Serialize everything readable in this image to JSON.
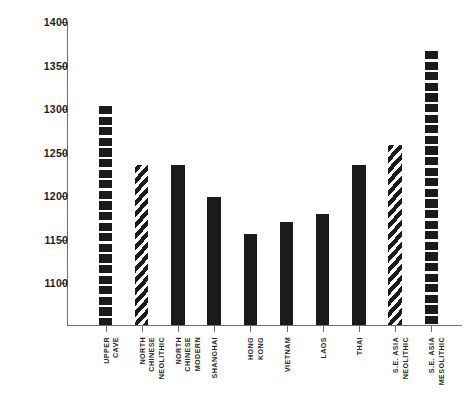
{
  "chart_data": {
    "type": "bar",
    "title": "",
    "subtitle": "",
    "xlabel": "",
    "ylabel": "",
    "ylim": [
      1052,
      1400
    ],
    "grid": false,
    "legend": "none",
    "y_ticks": [
      1100,
      1150,
      1200,
      1250,
      1300,
      1350,
      1400
    ],
    "y_tick_labels": [
      "1100",
      "1150",
      "1200",
      "1250",
      "1300",
      "1350",
      "1400"
    ],
    "categories": [
      "UPPER CAVE",
      "NORTH CHINESE NEOLITHIC",
      "NORTH CHINESE MODERN",
      "SHANGHAI",
      "HONG KONG",
      "VIETNAM",
      "LAOS",
      "THAI",
      "S.E. ASIA NEOLITHIC",
      "S.E. ASIA MESOLITHIC"
    ],
    "category_lines": [
      [
        "UPPER",
        "CAVE"
      ],
      [
        "NORTH",
        "CHINESE",
        "NEOLITHIC"
      ],
      [
        "NORTH",
        "CHINESE",
        "MODERN"
      ],
      [
        "SHANGHAI"
      ],
      [
        "HONG",
        "KONG"
      ],
      [
        "VIETNAM"
      ],
      [
        "LAOS"
      ],
      [
        "THAI"
      ],
      [
        "S.E. ASIA",
        "NEOLITHIC"
      ],
      [
        "S.E. ASIA",
        "MESOLITHIC"
      ]
    ],
    "values": [
      1303,
      1236,
      1236,
      1199,
      1156,
      1170,
      1180,
      1236,
      1259,
      1367
    ],
    "patterns": [
      "block",
      "hatch",
      "solid",
      "solid",
      "solid",
      "solid",
      "solid",
      "solid",
      "hatch",
      "block"
    ],
    "colors": {
      "bar": "#1b1b1b",
      "axis": "#6f6f6f",
      "text": "#1c1c1c",
      "background": "#ffffff"
    }
  }
}
